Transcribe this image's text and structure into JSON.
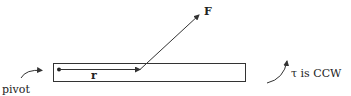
{
  "diagram": {
    "labels": {
      "force": "F",
      "radius": "r",
      "pivot": "pivot",
      "torque": "τ is CCW"
    },
    "colors": {
      "stroke": "#333333",
      "text": "#222222"
    }
  }
}
